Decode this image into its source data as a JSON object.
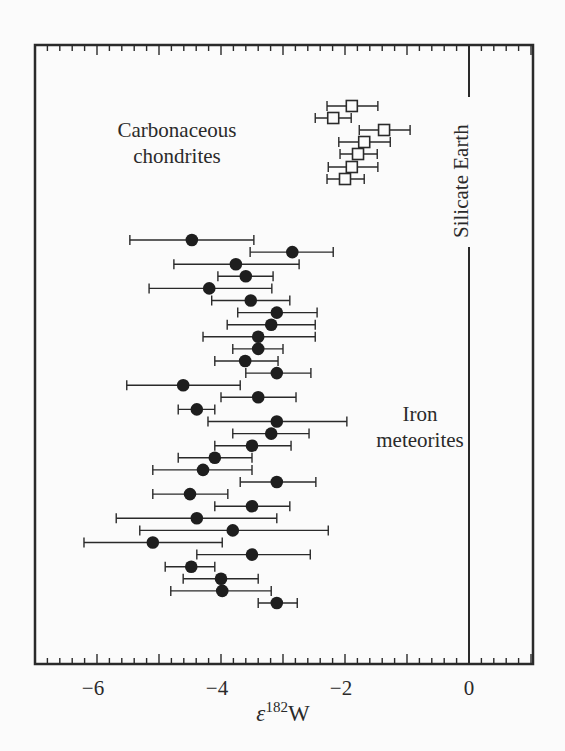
{
  "chart_data": {
    "type": "scatter",
    "title": "",
    "xlabel": "ε182W",
    "xlabel_parts": {
      "symbol": "ε",
      "superscript": "182",
      "element": "W"
    },
    "ylabel": "",
    "xlim": [
      -7,
      1
    ],
    "x_ticks": [
      -6,
      -4,
      -2,
      0
    ],
    "x_tick_labels": [
      "−6",
      "−4",
      "−2",
      "0"
    ],
    "minor_tick_step": 0.2,
    "grid": false,
    "legend": null,
    "reference_line": {
      "x": 0,
      "label": "Silicate Earth"
    },
    "annotations": [
      {
        "text": [
          "Carbonaceous",
          "chondrites"
        ],
        "near": "top-left"
      },
      {
        "text": [
          "Iron",
          "meteorites"
        ],
        "near": "right-middle"
      }
    ],
    "series": [
      {
        "name": "Carbonaceous chondrites",
        "marker": "open-square",
        "points": [
          {
            "x": -1.89,
            "xmin": -2.29,
            "xmax": -1.47
          },
          {
            "x": -2.19,
            "xmin": -2.48,
            "xmax": -1.9
          },
          {
            "x": -1.37,
            "xmin": -1.77,
            "xmax": -0.95
          },
          {
            "x": -1.69,
            "xmin": -2.1,
            "xmax": -1.27
          },
          {
            "x": -1.79,
            "xmin": -2.08,
            "xmax": -1.48
          },
          {
            "x": -1.89,
            "xmin": -2.27,
            "xmax": -1.47
          },
          {
            "x": -2.0,
            "xmin": -2.29,
            "xmax": -1.69
          }
        ]
      },
      {
        "name": "Iron meteorites",
        "marker": "filled-circle",
        "points": [
          {
            "x": -4.47,
            "xmin": -5.47,
            "xmax": -3.47
          },
          {
            "x": -2.85,
            "xmin": -3.53,
            "xmax": -2.19
          },
          {
            "x": -3.76,
            "xmin": -4.76,
            "xmax": -2.74
          },
          {
            "x": -3.6,
            "xmin": -4.05,
            "xmax": -3.16
          },
          {
            "x": -4.19,
            "xmin": -5.16,
            "xmax": -3.18
          },
          {
            "x": -3.52,
            "xmin": -4.15,
            "xmax": -2.89
          },
          {
            "x": -3.1,
            "xmin": -3.73,
            "xmax": -2.45
          },
          {
            "x": -3.19,
            "xmin": -3.9,
            "xmax": -2.48
          },
          {
            "x": -3.4,
            "xmin": -4.29,
            "xmax": -2.48
          },
          {
            "x": -3.4,
            "xmin": -3.81,
            "xmax": -3.0
          },
          {
            "x": -3.61,
            "xmin": -4.1,
            "xmax": -3.08
          },
          {
            "x": -3.1,
            "xmin": -3.6,
            "xmax": -2.55
          },
          {
            "x": -4.61,
            "xmin": -5.52,
            "xmax": -3.69
          },
          {
            "x": -3.4,
            "xmin": -4.0,
            "xmax": -2.79
          },
          {
            "x": -4.39,
            "xmin": -4.69,
            "xmax": -4.1
          },
          {
            "x": -3.1,
            "xmin": -4.21,
            "xmax": -1.97
          },
          {
            "x": -3.19,
            "xmin": -3.81,
            "xmax": -2.58
          },
          {
            "x": -3.5,
            "xmin": -4.1,
            "xmax": -2.87
          },
          {
            "x": -4.1,
            "xmin": -4.69,
            "xmax": -3.5
          },
          {
            "x": -4.29,
            "xmin": -5.1,
            "xmax": -3.5
          },
          {
            "x": -3.1,
            "xmin": -3.69,
            "xmax": -2.47
          },
          {
            "x": -4.5,
            "xmin": -5.1,
            "xmax": -3.89
          },
          {
            "x": -3.5,
            "xmin": -4.1,
            "xmax": -2.89
          },
          {
            "x": -4.39,
            "xmin": -5.69,
            "xmax": -3.1
          },
          {
            "x": -3.81,
            "xmin": -5.31,
            "xmax": -2.27
          },
          {
            "x": -5.1,
            "xmin": -6.21,
            "xmax": -3.98
          },
          {
            "x": -3.5,
            "xmin": -4.39,
            "xmax": -2.56
          },
          {
            "x": -4.48,
            "xmin": -4.9,
            "xmax": -4.1
          },
          {
            "x": -4.0,
            "xmin": -4.61,
            "xmax": -3.4
          },
          {
            "x": -3.98,
            "xmin": -4.81,
            "xmax": -3.19
          },
          {
            "x": -3.1,
            "xmin": -3.4,
            "xmax": -2.77
          }
        ]
      }
    ]
  },
  "labels": {
    "carbonaceous_line1": "Carbonaceous",
    "carbonaceous_line2": "chondrites",
    "iron_line1": "Iron",
    "iron_line2": "meteorites",
    "silicate_earth": "Silicate Earth",
    "xlabel_symbol": "ε",
    "xlabel_sup": "182",
    "xlabel_element": "W"
  },
  "colors": {
    "ink": "#2a2a2a",
    "background": "#fbfbfb"
  }
}
